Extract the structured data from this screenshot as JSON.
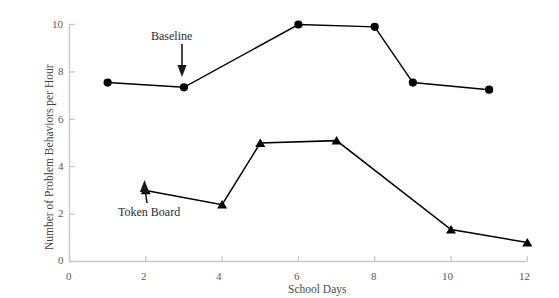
{
  "chart_data": {
    "type": "line",
    "title": "",
    "xlabel": "School Days",
    "ylabel": "Number of Problem Behaviors per Hour",
    "xlim": [
      0,
      12
    ],
    "ylim": [
      0,
      10
    ],
    "xticks": [
      0,
      2,
      4,
      6,
      8,
      10,
      12
    ],
    "yticks": [
      0,
      2,
      4,
      6,
      8,
      10
    ],
    "xtick_labels": [
      "0",
      "2",
      "4",
      "6",
      "8",
      "10",
      "12"
    ],
    "ytick_labels": [
      "0",
      "2",
      "4",
      "6",
      "8",
      "10"
    ],
    "grid": false,
    "legend": "none",
    "series": [
      {
        "name": "Baseline",
        "marker": "circle",
        "color": "#000000",
        "x": [
          1,
          3,
          6,
          8,
          9,
          11
        ],
        "values": [
          7.55,
          7.35,
          10.0,
          9.9,
          7.55,
          7.25
        ]
      },
      {
        "name": "Token Board",
        "marker": "triangle",
        "color": "#000000",
        "x": [
          2,
          4,
          5,
          7,
          10,
          12
        ],
        "values": [
          3.0,
          2.4,
          5.0,
          5.1,
          1.35,
          0.8
        ]
      }
    ],
    "annotations": [
      {
        "text": "Baseline",
        "points_to_x": 3,
        "points_to_y": 7.35,
        "arrow": "down"
      },
      {
        "text": "Token Board",
        "points_to_x": 2,
        "points_to_y": 3.0,
        "arrow": "up"
      }
    ]
  },
  "axis": {
    "line_color": "#c9c9cb",
    "tick_color": "#c9c9cb"
  }
}
